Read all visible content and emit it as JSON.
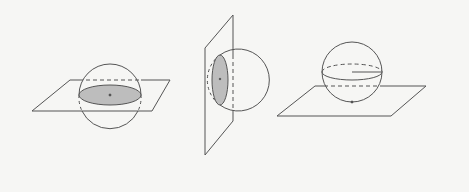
{
  "figure": {
    "colors": {
      "background": "#f6f6f4",
      "stroke": "#555555",
      "fill": "#bdbdbd"
    },
    "panels": [
      {
        "id": "horizontal-section",
        "label": "Plane through center (horizontal great circle)"
      },
      {
        "id": "vertical-section",
        "label": "Vertical plane cutting sphere (small circle)"
      },
      {
        "id": "tangent-plane",
        "label": "Sphere tangent to plane"
      }
    ]
  }
}
